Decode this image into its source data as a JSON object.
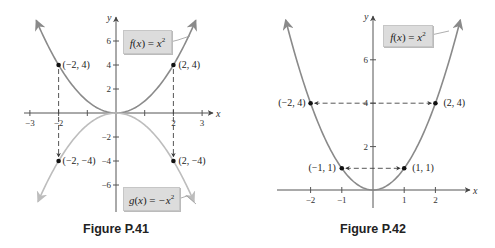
{
  "chart_data": [
    {
      "type": "line",
      "title": "Figure P.41",
      "xlabel": "x",
      "ylabel": "y",
      "xlim": [
        -3,
        3
      ],
      "ylim": [
        -7.5,
        7.5
      ],
      "grid": false,
      "x_ticks": [
        -3,
        -2,
        -1,
        1,
        2,
        3
      ],
      "x_tick_labels": [
        "-3",
        "-2",
        "",
        "",
        "2",
        "3"
      ],
      "y_ticks": [
        6,
        4,
        2,
        -2,
        -4,
        -6
      ],
      "y_tick_labels": [
        "6",
        "4",
        "2",
        "-2",
        "-4",
        "-6"
      ],
      "series": [
        {
          "name": "f(x) = x^2",
          "label_html": "f(x) = x²",
          "function": "x^2",
          "color": "#8a8a8a",
          "x_range": [
            -2.78,
            2.78
          ]
        },
        {
          "name": "g(x) = -x^2",
          "label_html": "g(x) = -x²",
          "function": "-x^2",
          "color": "#bdbdbd",
          "x_range": [
            -2.72,
            2.72
          ]
        }
      ],
      "points": [
        {
          "x": -2,
          "y": 4,
          "label": "(−2, 4)"
        },
        {
          "x": 2,
          "y": 4,
          "label": "(2, 4)"
        },
        {
          "x": -2,
          "y": -4,
          "label": "(−2, −4)"
        },
        {
          "x": 2,
          "y": -4,
          "label": "(2, −4)"
        }
      ],
      "annotations": [
        {
          "type": "dashed-arrow",
          "from": [
            -2,
            4
          ],
          "to": [
            -2,
            -4
          ],
          "note": "reflection across x-axis"
        },
        {
          "type": "dashed-arrow",
          "from": [
            2,
            4
          ],
          "to": [
            2,
            -4
          ],
          "note": "reflection across x-axis"
        }
      ]
    },
    {
      "type": "line",
      "title": "Figure P.42",
      "xlabel": "x",
      "ylabel": "y",
      "xlim": [
        -2.9,
        2.9
      ],
      "ylim": [
        0,
        8
      ],
      "grid": false,
      "x_ticks": [
        -2,
        -1,
        1,
        2
      ],
      "x_tick_labels": [
        "-2",
        "-1",
        "1",
        "2"
      ],
      "y_ticks": [
        6,
        4,
        2
      ],
      "y_tick_labels": [
        "6",
        "4",
        "2"
      ],
      "series": [
        {
          "name": "f(x) = x^2",
          "label_html": "f(x) = x²",
          "function": "x^2",
          "color": "#8a8a8a",
          "x_range": [
            -2.8,
            2.8
          ]
        }
      ],
      "points": [
        {
          "x": -2,
          "y": 4,
          "label": "(−2, 4)"
        },
        {
          "x": 2,
          "y": 4,
          "label": "(2, 4)"
        },
        {
          "x": -1,
          "y": 1,
          "label": "(−1, 1)"
        },
        {
          "x": 1,
          "y": 1,
          "label": "(1, 1)"
        }
      ],
      "annotations": [
        {
          "type": "dashed-double-arrow",
          "from": [
            -2,
            4
          ],
          "to": [
            2,
            4
          ],
          "note": "symmetric about y-axis"
        },
        {
          "type": "dashed-double-arrow",
          "from": [
            -1,
            1
          ],
          "to": [
            1,
            1
          ],
          "note": "symmetric about y-axis"
        }
      ]
    }
  ],
  "figures": {
    "p41": {
      "caption": "Figure P.41",
      "f_label": {
        "name": "f",
        "arg": "x",
        "rhs": "x",
        "exp": "2"
      },
      "g_label": {
        "name": "g",
        "arg": "x",
        "rhs": "−x",
        "exp": "2"
      },
      "x_axis_label": "x",
      "y_axis_label": "y"
    },
    "p42": {
      "caption": "Figure P.42",
      "f_label": {
        "name": "f",
        "arg": "x",
        "rhs": "x",
        "exp": "2"
      },
      "x_axis_label": "x",
      "y_axis_label": "y"
    }
  }
}
